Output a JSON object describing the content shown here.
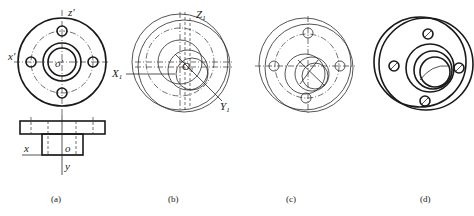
{
  "figures": [
    {
      "id": "a",
      "caption": "(a)",
      "top_view_labels": {
        "z_prime": "z'",
        "x_prime": "x'",
        "o_prime": "o'"
      },
      "front_view_labels": {
        "x": "x",
        "o": "o",
        "y": "y"
      }
    },
    {
      "id": "b",
      "caption": "(b)",
      "labels": {
        "z1": "Z",
        "z1_sub": "1",
        "x1": "X",
        "x1_sub": "1",
        "o1": "O",
        "o1_sub": "1",
        "y1": "Y",
        "y1_sub": "1"
      }
    },
    {
      "id": "c",
      "caption": "(c)"
    },
    {
      "id": "d",
      "caption": "(d)"
    }
  ]
}
